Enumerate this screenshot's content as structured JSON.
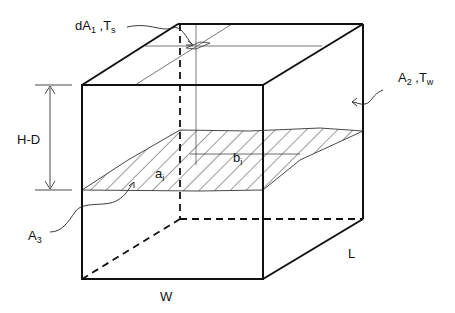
{
  "figure": {
    "type": "3D box enclosure diagram with partially filled cross-section",
    "colors": {
      "stroke": "#111111",
      "background": "#ffffff"
    }
  },
  "labels": {
    "dA1": {
      "main": "dA",
      "sub": "1",
      "sep": " ,T",
      "sub2": "s"
    },
    "A2": {
      "main": "A",
      "sub": "2",
      "sep": " ,T",
      "sub2": "w"
    },
    "A3": {
      "main": "A",
      "sub": "3"
    },
    "HD": "H-D",
    "ai": {
      "main": "a",
      "sub": "i"
    },
    "bi": {
      "main": "b",
      "sub": "i"
    },
    "W": "W",
    "L": "L"
  }
}
